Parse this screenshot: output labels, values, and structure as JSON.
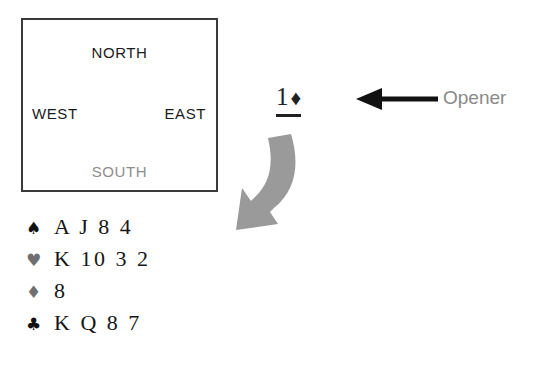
{
  "diagram": {
    "compass": {
      "north": "NORTH",
      "west": "WEST",
      "east": "EAST",
      "south": "SOUTH",
      "north_color": "#1b1b1b",
      "west_color": "#1b1b1b",
      "east_color": "#1b1b1b",
      "south_color": "#8d8d8d",
      "border_color": "#3a3a3a"
    },
    "bid": {
      "level": "1",
      "suit_symbol": "♦",
      "suit_name": "diamonds",
      "underlined": true,
      "color": "#202020"
    },
    "annotation": {
      "label": "Opener",
      "label_color": "#8a8a8a",
      "arrow_direction": "left",
      "arrow_color": "#111111"
    },
    "curved_arrow": {
      "color": "#9a9a9a",
      "from": "bid",
      "to": "hand",
      "direction": "down-left"
    },
    "hand": {
      "rows": [
        {
          "suit_symbol": "♠",
          "suit_name": "spades",
          "suit_class": "black",
          "cards": "A J 8 4"
        },
        {
          "suit_symbol": "♥",
          "suit_name": "hearts",
          "suit_class": "red",
          "cards": "K 10 3 2"
        },
        {
          "suit_symbol": "♦",
          "suit_name": "diamonds",
          "suit_class": "red",
          "cards": "8"
        },
        {
          "suit_symbol": "♣",
          "suit_name": "clubs",
          "suit_class": "black",
          "cards": "K Q 8 7"
        }
      ]
    }
  }
}
